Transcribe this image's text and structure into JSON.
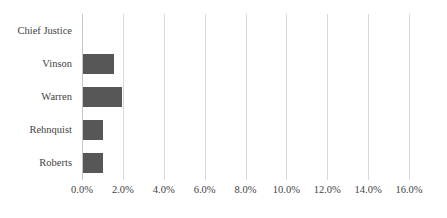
{
  "chart_data": {
    "type": "bar",
    "orientation": "horizontal",
    "title": "",
    "xlabel": "",
    "ylabel": "",
    "categories": [
      "Chief Justice",
      "Vinson",
      "Warren",
      "Rehnquist",
      "Roberts"
    ],
    "values": [
      null,
      1.5,
      1.9,
      1.0,
      1.0
    ],
    "series": [
      {
        "name": "",
        "values": [
          null,
          1.5,
          1.9,
          1.0,
          1.0
        ]
      }
    ],
    "xlim": [
      0.0,
      16.0
    ],
    "xticks": [
      0.0,
      2.0,
      4.0,
      6.0,
      8.0,
      10.0,
      12.0,
      14.0,
      16.0
    ],
    "xtick_labels": [
      "0.0%",
      "2.0%",
      "4.0%",
      "6.0%",
      "8.0%",
      "10.0%",
      "12.0%",
      "14.0%",
      "16.0%"
    ],
    "value_suffix": "%",
    "grid": "vertical",
    "legend": "none",
    "bar_color": "#575757",
    "gridline_color": "#d9d9d9",
    "text_color": "#3f3f3f",
    "background_color": "#ffffff"
  }
}
